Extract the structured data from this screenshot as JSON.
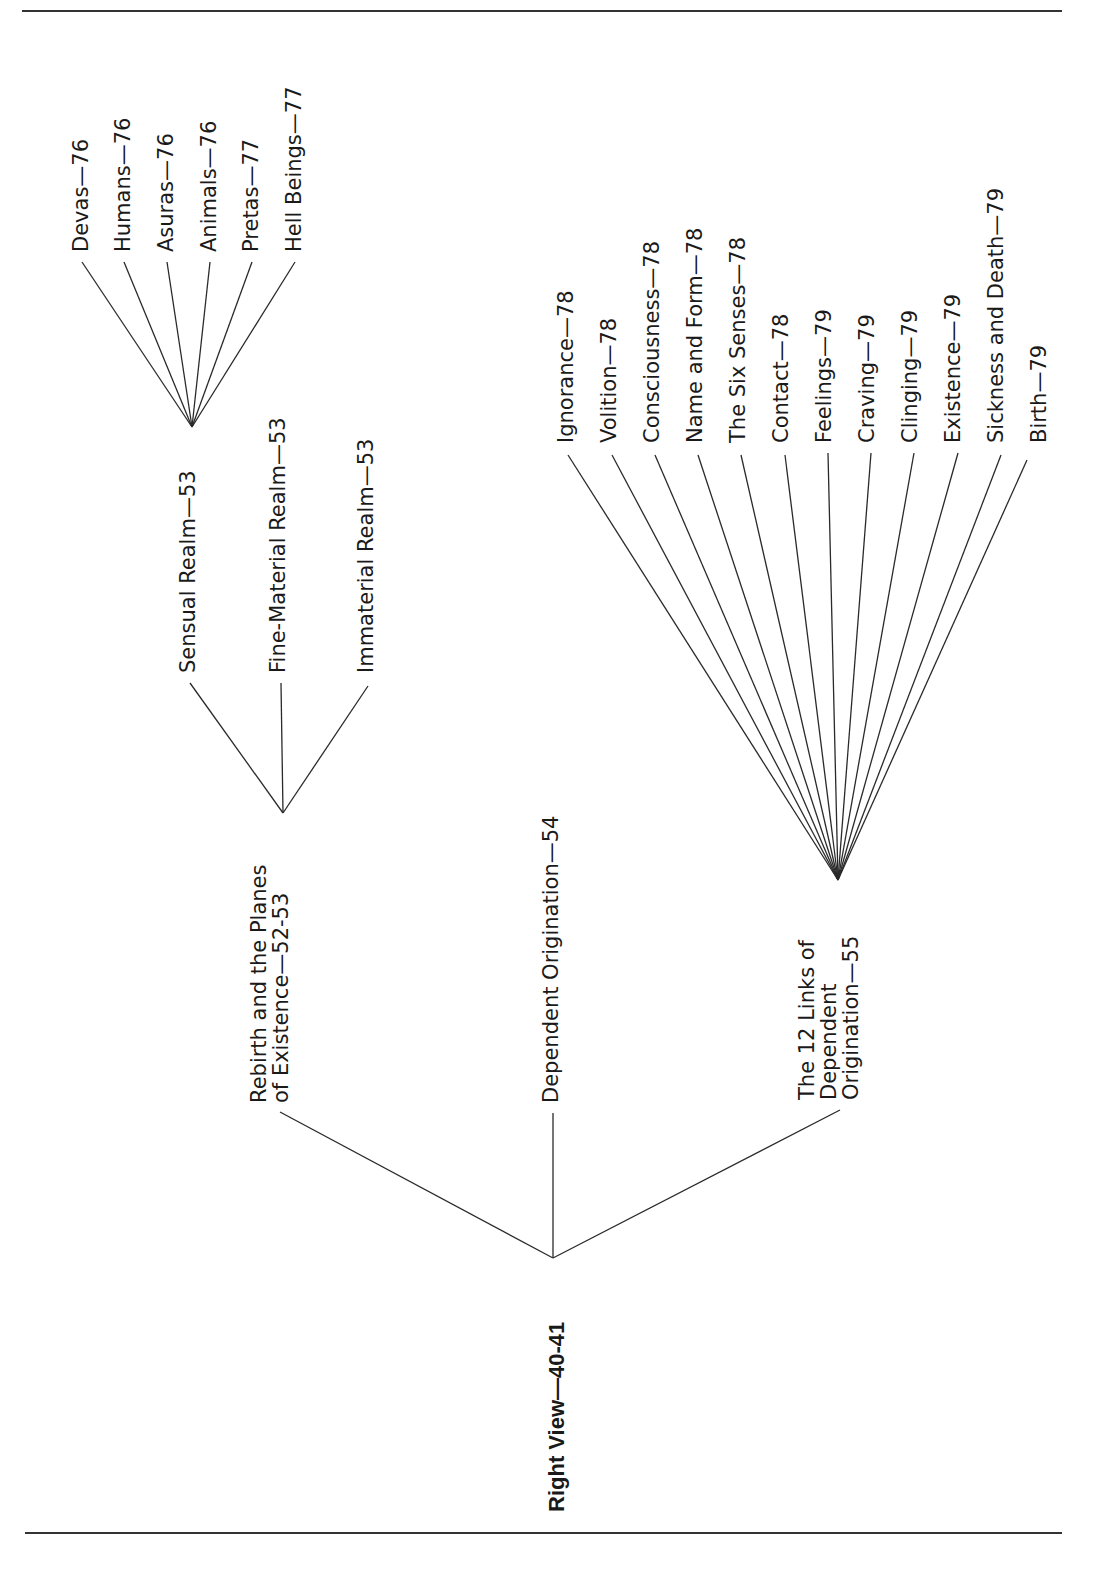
{
  "diagram": {
    "orientation": "rotated -90deg (reads bottom to top)",
    "root": {
      "label": "Right View—40-41"
    },
    "level1": [
      {
        "id": "rebirth",
        "lines": [
          "Rebirth and the Planes",
          "of Existence—52-53"
        ]
      },
      {
        "id": "dep-orig",
        "lines": [
          "Dependent Origination—54"
        ]
      },
      {
        "id": "links12",
        "lines": [
          "The 12 Links of",
          "Dependent",
          "Origination—55"
        ]
      }
    ],
    "realms": [
      {
        "label": "Sensual Realm—53"
      },
      {
        "label": "Fine-Material Realm—53"
      },
      {
        "label": "Immaterial Realm—53"
      }
    ],
    "beings": [
      {
        "label": "Devas—76"
      },
      {
        "label": "Humans—76"
      },
      {
        "label": "Asuras—76"
      },
      {
        "label": "Animals—76"
      },
      {
        "label": "Pretas—77"
      },
      {
        "label": "Hell Beings—77"
      }
    ],
    "links": [
      {
        "label": "Ignorance—78"
      },
      {
        "label": "Volition—78"
      },
      {
        "label": "Consciousness—78"
      },
      {
        "label": "Name and Form—78"
      },
      {
        "label": "The Six Senses—78"
      },
      {
        "label": "Contact—78"
      },
      {
        "label": "Feelings—79"
      },
      {
        "label": "Craving—79"
      },
      {
        "label": "Clinging—79"
      },
      {
        "label": "Existence—79"
      },
      {
        "label": "Sickness and Death—79"
      },
      {
        "label": "Birth—79"
      }
    ]
  }
}
